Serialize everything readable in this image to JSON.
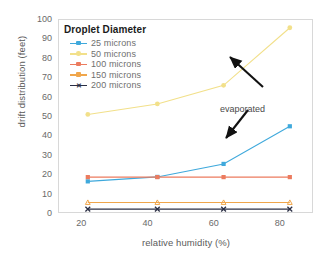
{
  "chart_data": {
    "type": "line",
    "title": "",
    "xlabel": "relative humidity (%)",
    "ylabel": "drift distribution (feet)",
    "xlim": [
      13,
      90
    ],
    "ylim": [
      0,
      100
    ],
    "xticks": [
      20,
      40,
      60,
      80
    ],
    "yticks": [
      0,
      10,
      20,
      30,
      40,
      50,
      60,
      70,
      80,
      90,
      100
    ],
    "grid": false,
    "legend_position": "inside-top-left",
    "legend_title": "Droplet Diameter",
    "x": [
      22,
      43,
      63,
      83
    ],
    "series": [
      {
        "name": "25 microns",
        "color": "#3FA9DC",
        "marker": "square",
        "values": [
          16.3,
          18.6,
          25.3,
          44.7
        ]
      },
      {
        "name": "50 microns",
        "color": "#F2E08A",
        "marker": "circle",
        "values": [
          50.8,
          56.2,
          65.8,
          95.5
        ]
      },
      {
        "name": "100 microns",
        "color": "#EC7B5E",
        "marker": "square",
        "values": [
          18.5,
          18.5,
          18.5,
          18.5
        ]
      },
      {
        "name": "150 microns",
        "color": "#F0A64B",
        "marker": "triangle",
        "values": [
          5.4,
          5.4,
          5.4,
          5.4
        ]
      },
      {
        "name": "200 microns",
        "color": "#2B2F45",
        "marker": "x",
        "values": [
          2.0,
          2.0,
          2.0,
          2.0
        ]
      }
    ],
    "annotations": [
      {
        "text": "evaporated",
        "target_series": [
          "50 microns",
          "25 microns"
        ],
        "arrows": 2
      }
    ]
  }
}
